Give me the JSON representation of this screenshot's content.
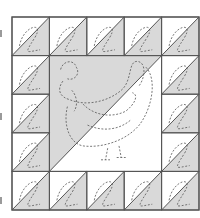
{
  "diagram": {
    "colors": {
      "background": "#ffffff",
      "shade": "#d9d9d9",
      "light": "#ffffff",
      "line": "#555555",
      "dash": "#555555"
    },
    "grid": {
      "x0": 12,
      "y0": 17,
      "x1": 199,
      "y1": 210,
      "cols": 5,
      "rows": 5
    },
    "border_cells": {
      "orientation": "diagonal bottom-left to top-right; upper-left white, lower-right shaded",
      "positions": [
        [
          0,
          0
        ],
        [
          1,
          0
        ],
        [
          2,
          0
        ],
        [
          3,
          0
        ],
        [
          4,
          0
        ],
        [
          0,
          1
        ],
        [
          4,
          1
        ],
        [
          0,
          2
        ],
        [
          4,
          2
        ],
        [
          0,
          3
        ],
        [
          4,
          3
        ],
        [
          0,
          4
        ],
        [
          1,
          4
        ],
        [
          2,
          4
        ],
        [
          3,
          4
        ],
        [
          4,
          4
        ]
      ]
    },
    "center_block": {
      "col": 1,
      "row": 1,
      "span": 3,
      "upper_left": "shaded",
      "lower_right": "white",
      "motif": "hen (dashed quilting outline)"
    },
    "edge_marks": [
      33,
      116,
      200
    ]
  }
}
